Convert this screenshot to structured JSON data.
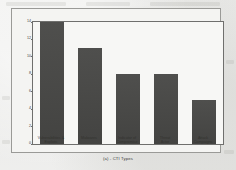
{
  "figure": {
    "caption": "(a)  -  CTI Types"
  },
  "chart_data": {
    "type": "bar",
    "title": "",
    "subtitle": "",
    "xlabel": "",
    "ylabel": "Number of Answers",
    "categories": [
      "Vulnerabilities &\nExploits",
      "Malwares",
      "Indicator of\nCompromise",
      "Threat\nActor",
      "Attack\nCampaigns"
    ],
    "values": [
      14,
      11,
      8,
      8,
      5
    ],
    "ylim": [
      0,
      14
    ],
    "yticks": [
      0,
      2,
      4,
      6,
      8,
      10,
      12,
      14
    ],
    "ytick_labels": [
      "0",
      "2",
      "4",
      "6",
      "8",
      "10",
      "12",
      "14"
    ],
    "grid": false,
    "legend": null,
    "bar_color": "#474745",
    "frame_color": "#6f6f6d",
    "background_color": "#f7f7f5"
  }
}
